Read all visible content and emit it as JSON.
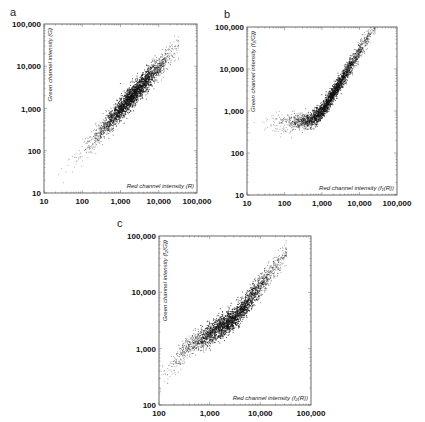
{
  "chart_data": [
    {
      "panel": "a",
      "type": "scatter",
      "xscale": "log",
      "yscale": "log",
      "xlim": [
        10,
        100000
      ],
      "ylim": [
        10,
        100000
      ],
      "xticks": [
        "10",
        "100",
        "1,000",
        "10,000",
        "100,000"
      ],
      "yticks": [
        "10",
        "100",
        "1,000",
        "10,000",
        "100,000"
      ],
      "xlabel": "Red channel intensity (R)",
      "ylabel": "Green channel intensity (G)",
      "grid": false,
      "description": "Dense cloud along the diagonal G ≈ R, from ~15 to ~30,000, densest between 1,000 and 10,000",
      "trend": {
        "kind": "linear_log",
        "x_center_log": 3.3,
        "x_spread_log": 0.55,
        "x_min_log": 1.1,
        "x_max_log": 4.5,
        "slope": 1.0,
        "intercept": 0.0,
        "noise_log": 0.13,
        "n": 2600
      }
    },
    {
      "panel": "b",
      "type": "scatter",
      "xscale": "log",
      "yscale": "log",
      "xlim": [
        10,
        100000
      ],
      "ylim": [
        10,
        100000
      ],
      "xticks": [
        "10",
        "100",
        "1,000",
        "10,000",
        "100,000"
      ],
      "yticks": [
        "10",
        "100",
        "1,000",
        "10,000",
        "100,000"
      ],
      "xlabel": "Red channel intensity (f₁(R))",
      "ylabel": "Green channel intensity (f₁(G))",
      "grid": false,
      "description": "Flat floor near G ≈ 500–700 for R from 10 to ~500, then curves upward to G ≈ 10,000–20,000 at R ≈ 10,000–20,000",
      "trend": {
        "kind": "floor_curve",
        "x_center_log": 3.2,
        "x_spread_log": 0.6,
        "x_min_log": 1.0,
        "x_max_log": 4.4,
        "floor_log": 2.75,
        "noise_log": 0.1,
        "n": 2600
      }
    },
    {
      "panel": "c",
      "type": "scatter",
      "xscale": "log",
      "yscale": "log",
      "xlim": [
        100,
        100000
      ],
      "ylim": [
        100,
        100000
      ],
      "xticks": [
        "100",
        "1,000",
        "10,000",
        "100,000"
      ],
      "yticks": [
        "100",
        "1,000",
        "10,000",
        "100,000"
      ],
      "xlabel": "Red channel intensity (f₂(R))",
      "ylabel": "Green channel intensity (f₂(G))",
      "grid": false,
      "description": "Sigmoid-ish band: rises steeply from G ≈ 300 at R ≈ 100 to G ≈ 1,000 at R ≈ 300, flatter slope to G ≈ 3,000 at R ≈ 3,000, then steeper to G ≈ 20,000 at R ≈ 20,000",
      "trend": {
        "kind": "s_curve",
        "x_center_log": 3.4,
        "x_spread_log": 0.55,
        "x_min_log": 2.0,
        "x_max_log": 4.5,
        "noise_log": 0.1,
        "n": 2600
      }
    }
  ],
  "panels": {
    "a": {
      "label": "a"
    },
    "b": {
      "label": "b"
    },
    "c": {
      "label": "c"
    }
  }
}
